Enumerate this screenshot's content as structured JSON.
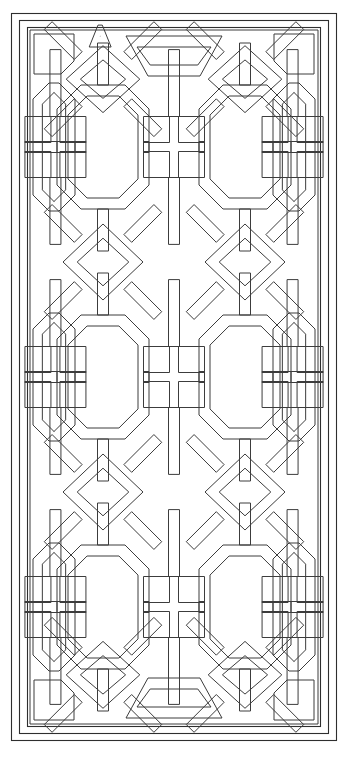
{
  "artwork": {
    "title": "Decorative Lattice Panel",
    "subject": "Chinese-style geometric fretwork screen / window lattice",
    "style": "line drawing, uncolored outline (coloring-page style)",
    "width": 349,
    "height": 766
  },
  "colors": {
    "background": "#ffffff",
    "line": "#3c3c3c",
    "frame_line": "#2e2e2e",
    "fill": "none"
  },
  "stroke": {
    "frame_width": 1.1,
    "lattice_width": 1.0,
    "linejoin": "miter",
    "linecap": "butt"
  },
  "frame": {
    "count": 3,
    "rects": [
      {
        "name": "outer-frame",
        "x": 11.5,
        "y": 13.5,
        "w": 325,
        "h": 727
      },
      {
        "name": "middle-frame",
        "x": 19.5,
        "y": 20.5,
        "w": 309,
        "h": 713
      },
      {
        "name": "inner-frame",
        "x": 27.5,
        "y": 27.5,
        "w": 293,
        "h": 699
      }
    ]
  },
  "grid": {
    "content_x": 32,
    "content_y": 32,
    "content_w": 284,
    "content_h": 690,
    "module_columns": 2,
    "module_rows": 3,
    "module_width": 142,
    "module_height": 230,
    "band_thickness": 11,
    "corner_chamfer": 13
  },
  "motifs": {
    "center_octagon": {
      "name": "large-octagon",
      "outer_w": 92,
      "outer_h": 124,
      "chamfer": 24,
      "band": 11,
      "count_per_module": 1
    },
    "diamond": {
      "name": "diamond",
      "half_diagonal_x": 40,
      "half_diagonal_y": 38,
      "band": 10,
      "count": 8
    },
    "square_cluster": {
      "name": "four-square-cluster",
      "arrangement": "2x2",
      "cell": 26,
      "gap": 9,
      "count": 12
    },
    "side_panel": {
      "name": "tall-side-octagon",
      "w": 42,
      "h": 128,
      "chamfer": 16,
      "count": 6
    },
    "corner_block": {
      "name": "corner-chamfered-square",
      "size": 40,
      "count": 4
    },
    "edge_trapezoid": {
      "name": "half-octagon-edge",
      "count": 6
    }
  },
  "labels": {
    "panel": "lattice-panel",
    "canvas": "drawing-canvas"
  }
}
